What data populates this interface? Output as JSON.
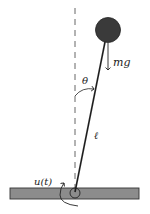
{
  "diagram": {
    "type": "inverted-pendulum",
    "labels": {
      "gravity": "mg",
      "angle": "θ",
      "length": "ℓ",
      "input": "u(t)"
    },
    "colors": {
      "bob": "#3a3a3a",
      "rod": "#1e1e1e",
      "ground_fill": "#8c8c8c",
      "ground_stroke": "#333333",
      "dashed_line": "#555555"
    }
  }
}
